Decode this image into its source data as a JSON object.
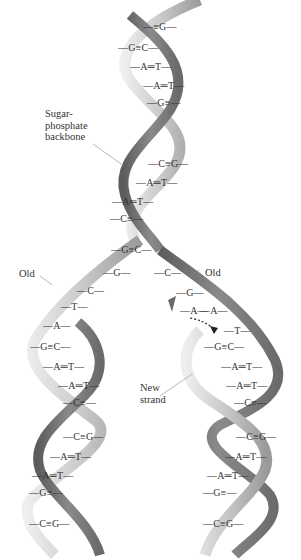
{
  "figure": {
    "labels": {
      "backbone": "Sugar-\nphosphate\nbackbone",
      "backbone_lines": [
        "Sugar-",
        "phosphate",
        "backbone"
      ],
      "old_left": "Old",
      "old_right": "Old",
      "new_strand_lines": [
        "New",
        "strand"
      ]
    },
    "parent_helix_pairs": [
      {
        "text": "≡G",
        "x": 143,
        "y": 27
      },
      {
        "text": "G≡C",
        "x": 118,
        "y": 48
      },
      {
        "text": "A═T",
        "x": 130,
        "y": 67
      },
      {
        "text": "A═T",
        "x": 143,
        "y": 86
      },
      {
        "text": "G≡",
        "x": 147,
        "y": 103
      },
      {
        "text": "C≡G",
        "x": 148,
        "y": 164
      },
      {
        "text": "A═T",
        "x": 136,
        "y": 183
      },
      {
        "text": "A═T",
        "x": 112,
        "y": 202
      },
      {
        "text": "C≡",
        "x": 110,
        "y": 219
      },
      {
        "text": "G≡C",
        "x": 111,
        "y": 250
      }
    ],
    "left_unpaired": [
      {
        "text": "G",
        "x": 103,
        "y": 273
      },
      {
        "text": "C",
        "x": 77,
        "y": 291
      },
      {
        "text": "T",
        "x": 61,
        "y": 307
      },
      {
        "text": "A",
        "x": 43,
        "y": 326
      }
    ],
    "right_unpaired": [
      {
        "text": "C",
        "x": 154,
        "y": 273
      },
      {
        "text": "G",
        "x": 176,
        "y": 293
      },
      {
        "text": "A",
        "x": 180,
        "y": 311
      },
      {
        "text": "A",
        "x": 200,
        "y": 311
      },
      {
        "text": "T",
        "x": 224,
        "y": 331
      }
    ],
    "left_daughter_pairs": [
      {
        "text": "G≡C",
        "x": 30,
        "y": 347
      },
      {
        "text": "A═T",
        "x": 43,
        "y": 367
      },
      {
        "text": "A═T",
        "x": 58,
        "y": 386
      },
      {
        "text": "C≡",
        "x": 63,
        "y": 403
      },
      {
        "text": "C≡G",
        "x": 63,
        "y": 437
      },
      {
        "text": "A═T",
        "x": 50,
        "y": 457
      },
      {
        "text": "A═T",
        "x": 32,
        "y": 476
      },
      {
        "text": "G≡",
        "x": 29,
        "y": 493
      },
      {
        "text": "C≡G",
        "x": 29,
        "y": 524
      }
    ],
    "right_daughter_pairs": [
      {
        "text": "G≡C",
        "x": 204,
        "y": 347
      },
      {
        "text": "A═T",
        "x": 221,
        "y": 367
      },
      {
        "text": "A═T",
        "x": 226,
        "y": 386
      },
      {
        "text": "C≡",
        "x": 234,
        "y": 403
      },
      {
        "text": "C≡G",
        "x": 236,
        "y": 437
      },
      {
        "text": "A═T",
        "x": 225,
        "y": 457
      },
      {
        "text": "A═T",
        "x": 207,
        "y": 476
      },
      {
        "text": "G≡",
        "x": 203,
        "y": 493
      },
      {
        "text": "C≡G",
        "x": 203,
        "y": 524
      }
    ],
    "colors": {
      "backbone_light": "#d4d4d4",
      "backbone_mid": "#a8a8a8",
      "backbone_dark": "#6e6e6e",
      "text": "#333333",
      "arrow": "#222222"
    }
  }
}
